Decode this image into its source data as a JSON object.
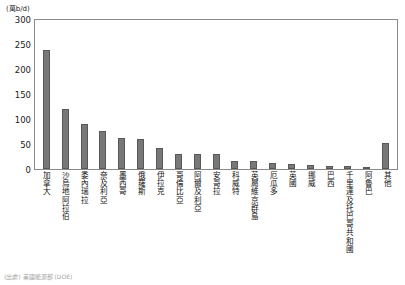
{
  "chart_data": {
    "type": "bar",
    "title": "",
    "subtitle": "",
    "unit_label": "(萬b/d)",
    "xlabel": "",
    "ylabel": "",
    "ylim": [
      0,
      300
    ],
    "yticks": [
      300,
      250,
      200,
      150,
      100,
      50,
      0
    ],
    "grid": false,
    "legend": null,
    "bar_color": "#787878",
    "bar_border_color": "#585858",
    "frame_color": "#8a8a8a",
    "categories": [
      "加拿大",
      "沙烏地阿拉伯",
      "委內瑞拉",
      "奈及利亞",
      "墨西哥",
      "俄羅斯",
      "伊拉克",
      "哥倫比亞",
      "阿爾及利亞",
      "安哥拉",
      "科威特",
      "英屬維京群島",
      "厄瓜多",
      "英國",
      "挪威",
      "巴西",
      "千里達及托巴哥共和國",
      "阿魯巴",
      "其他"
    ],
    "values": [
      240,
      120,
      90,
      77,
      62,
      60,
      42,
      31,
      30,
      30,
      17,
      17,
      12,
      10,
      9,
      7,
      6,
      4,
      53
    ]
  },
  "source_note": "(出處) 美國能源部 (DOE)"
}
